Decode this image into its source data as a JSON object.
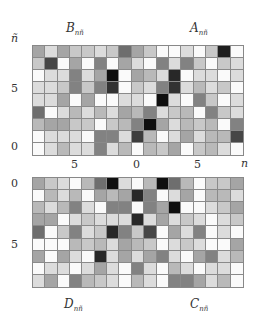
{
  "figure": {
    "panels": {
      "top_left_label": {
        "main": "B",
        "sub": "nñ"
      },
      "top_right_label": {
        "main": "A",
        "sub": "nñ"
      },
      "bottom_left_label": {
        "main": "D",
        "sub": "nñ"
      },
      "bottom_right_label": {
        "main": "C",
        "sub": "nñ"
      }
    },
    "axes": {
      "y_axis_label": "ñ",
      "x_axis_label": "n",
      "top_y_ticks": [
        "5",
        "0"
      ],
      "bottom_y_ticks": [
        "0",
        "5"
      ],
      "x_ticks": [
        "5",
        "0",
        "5"
      ]
    }
  },
  "chart_data": [
    {
      "type": "heatmap",
      "title": "B_{nñ} (left) | A_{nñ} (right)",
      "xlabel": "n",
      "ylabel": "ñ",
      "colormap": "grayscale (white = small, black = large)",
      "rows_top_to_bottom_ñ": [
        8,
        7,
        6,
        5,
        4,
        3,
        2,
        1,
        0
      ],
      "columns": 17,
      "values": [
        [
          165,
          220,
          165,
          200,
          200,
          220,
          200,
          110,
          165,
          200,
          250,
          250,
          220,
          250,
          200,
          30,
          250
        ],
        [
          200,
          70,
          250,
          165,
          250,
          130,
          250,
          165,
          220,
          250,
          130,
          220,
          130,
          200,
          250,
          200,
          220
        ],
        [
          250,
          220,
          220,
          130,
          220,
          165,
          15,
          250,
          165,
          185,
          220,
          40,
          250,
          220,
          220,
          250,
          220
        ],
        [
          220,
          220,
          200,
          130,
          200,
          130,
          50,
          250,
          200,
          220,
          130,
          50,
          220,
          185,
          220,
          200,
          250
        ],
        [
          220,
          220,
          165,
          250,
          165,
          250,
          250,
          220,
          220,
          250,
          15,
          220,
          250,
          130,
          200,
          250,
          220
        ],
        [
          110,
          250,
          220,
          185,
          220,
          185,
          220,
          165,
          185,
          130,
          220,
          200,
          185,
          250,
          130,
          200,
          220
        ],
        [
          185,
          165,
          165,
          200,
          200,
          250,
          200,
          185,
          130,
          15,
          165,
          220,
          185,
          200,
          185,
          250,
          130
        ],
        [
          250,
          220,
          220,
          220,
          250,
          130,
          130,
          220,
          60,
          185,
          250,
          220,
          165,
          220,
          185,
          185,
          70
        ],
        [
          250,
          220,
          185,
          220,
          220,
          130,
          220,
          185,
          250,
          185,
          200,
          165,
          250,
          200,
          185,
          220,
          250
        ]
      ]
    },
    {
      "type": "heatmap",
      "title": "D_{nñ} (left) | C_{nñ} (right)",
      "xlabel": "n",
      "ylabel": "ñ",
      "colormap": "grayscale (white = small, black = large)",
      "rows_top_to_bottom_ñ": [
        0,
        1,
        2,
        3,
        4,
        5,
        6,
        7,
        8
      ],
      "columns": 17,
      "values": [
        [
          165,
          200,
          220,
          250,
          185,
          110,
          15,
          220,
          250,
          185,
          15,
          110,
          185,
          250,
          200,
          200,
          165
        ],
        [
          250,
          185,
          220,
          185,
          250,
          165,
          185,
          165,
          40,
          130,
          250,
          220,
          165,
          250,
          185,
          185,
          220
        ],
        [
          185,
          220,
          185,
          130,
          220,
          250,
          130,
          130,
          250,
          130,
          165,
          15,
          250,
          250,
          220,
          200,
          165
        ],
        [
          165,
          165,
          250,
          220,
          200,
          220,
          220,
          220,
          40,
          220,
          165,
          220,
          200,
          220,
          250,
          220,
          200
        ],
        [
          110,
          250,
          200,
          130,
          220,
          200,
          40,
          130,
          200,
          70,
          250,
          165,
          220,
          130,
          250,
          220,
          250
        ],
        [
          250,
          250,
          250,
          185,
          200,
          185,
          220,
          165,
          185,
          200,
          250,
          220,
          200,
          220,
          250,
          250,
          165
        ],
        [
          165,
          250,
          165,
          220,
          250,
          40,
          220,
          165,
          220,
          165,
          130,
          220,
          250,
          165,
          130,
          220,
          185
        ],
        [
          250,
          220,
          220,
          250,
          220,
          165,
          220,
          250,
          130,
          220,
          250,
          185,
          220,
          250,
          220,
          220,
          250
        ],
        [
          220,
          165,
          250,
          130,
          185,
          200,
          220,
          250,
          185,
          220,
          250,
          130,
          130,
          165,
          220,
          185,
          250
        ]
      ]
    }
  ]
}
